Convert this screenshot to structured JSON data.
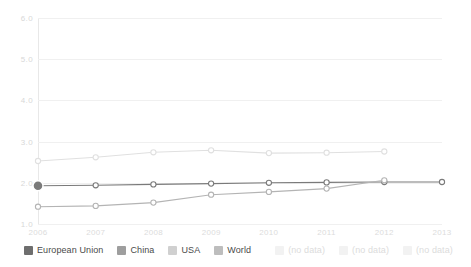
{
  "chart_data": {
    "type": "line",
    "title": "",
    "subtitle": "",
    "xlabel": "",
    "ylabel": "",
    "x": [
      2006,
      2007,
      2008,
      2009,
      2010,
      2011,
      2012,
      2013
    ],
    "xtick_labels": [
      "2006",
      "2007",
      "2008",
      "2009",
      "2010",
      "2011",
      "2012",
      "2013"
    ],
    "ytick_labels": [
      "6.0",
      "5.0",
      "4.0",
      "3.0",
      "2.0",
      "1.0"
    ],
    "ytick_values": [
      6.0,
      5.0,
      4.0,
      3.0,
      2.0,
      1.0
    ],
    "ylim": [
      1.0,
      6.0
    ],
    "xlim": [
      2006,
      2013
    ],
    "grid": true,
    "legend_position": "bottom-left",
    "highlight": {
      "series": "European Union",
      "x": 2006,
      "y": 1.93
    },
    "series": [
      {
        "name": "European Union",
        "color": "#7a7a7a",
        "values": [
          1.93,
          1.94,
          1.96,
          1.98,
          2.0,
          2.01,
          2.02,
          2.02
        ],
        "x": [
          2006,
          2007,
          2008,
          2009,
          2010,
          2011,
          2012,
          2013
        ]
      },
      {
        "name": "China",
        "color": "#b4b4b4",
        "values": [
          1.42,
          1.44,
          1.52,
          1.71,
          1.78,
          1.86,
          2.06
        ],
        "x": [
          2006,
          2007,
          2008,
          2009,
          2010,
          2011,
          2012
        ]
      },
      {
        "name": "USA",
        "color": "#e0e0e0",
        "values": [
          2.53,
          2.62,
          2.74,
          2.79,
          2.72,
          2.73,
          2.76
        ],
        "x": [
          2006,
          2007,
          2008,
          2009,
          2010,
          2011,
          2012
        ]
      },
      {
        "name": "World",
        "color": "#cfcfcf",
        "values": [],
        "x": []
      }
    ]
  },
  "legend": {
    "items": [
      {
        "label": "European Union",
        "color": "#6e6e6e",
        "muted": false
      },
      {
        "label": "China",
        "color": "#9e9e9e",
        "muted": false
      },
      {
        "label": "USA",
        "color": "#d0d0d0",
        "muted": false
      },
      {
        "label": "World",
        "color": "#bdbdbd",
        "muted": false
      },
      {
        "label": "(no data)",
        "color": "#f2f2f2",
        "muted": true
      },
      {
        "label": "(no data)",
        "color": "#f2f2f2",
        "muted": true
      },
      {
        "label": "(no data)",
        "color": "#f2f2f2",
        "muted": true
      }
    ]
  }
}
